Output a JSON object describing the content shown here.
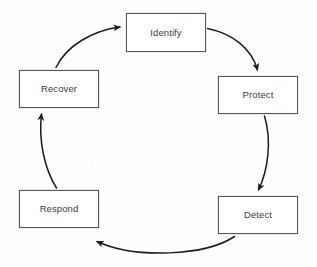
{
  "diagram": {
    "type": "cycle",
    "title": "",
    "direction": "clockwise",
    "background_color": "#fefefe",
    "box_fill_color": "#ffffff",
    "box_border_color": "#565656",
    "text_color": "#3b3b3b",
    "arrow_color": "#1d1d1d",
    "nodes": [
      {
        "id": "identify",
        "label": "Identify",
        "x": 126,
        "y": 13,
        "w": 80,
        "h": 39
      },
      {
        "id": "protect",
        "label": "Protect",
        "x": 218,
        "y": 76,
        "w": 80,
        "h": 38
      },
      {
        "id": "detect",
        "label": "Detect",
        "x": 218,
        "y": 196,
        "w": 80,
        "h": 38
      },
      {
        "id": "respond",
        "label": "Respond",
        "x": 19,
        "y": 190,
        "w": 80,
        "h": 38
      },
      {
        "id": "recover",
        "label": "Recover",
        "x": 19,
        "y": 70,
        "w": 80,
        "h": 38
      }
    ],
    "edges": [
      {
        "id": "identify-to-protect",
        "from": "identify",
        "to": "protect",
        "style": "curved-arrow"
      },
      {
        "id": "protect-to-detect",
        "from": "protect",
        "to": "detect",
        "style": "curved-arrow"
      },
      {
        "id": "detect-to-respond",
        "from": "detect",
        "to": "respond",
        "style": "curved-arrow"
      },
      {
        "id": "respond-to-recover",
        "from": "respond",
        "to": "recover",
        "style": "curved-arrow"
      },
      {
        "id": "recover-to-identify",
        "from": "recover",
        "to": "identify",
        "style": "curved-arrow"
      }
    ]
  }
}
